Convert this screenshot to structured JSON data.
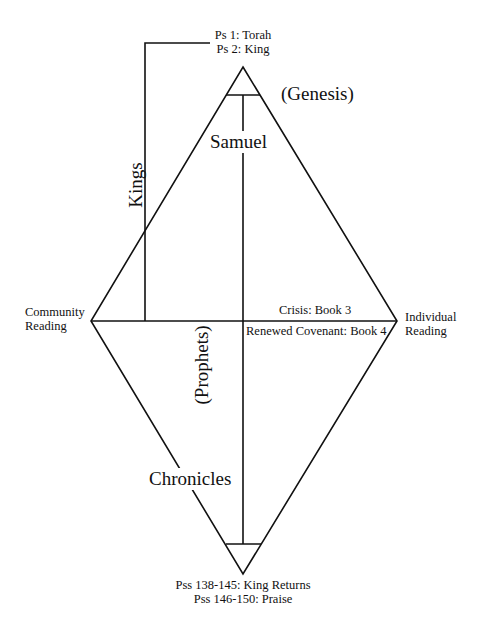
{
  "diagram": {
    "type": "rhombus-diagram",
    "colors": {
      "line": "#111111",
      "background": "#ffffff",
      "text": "#111111"
    },
    "top_label": {
      "line1": "Ps 1: Torah",
      "line2": "Ps 2: King"
    },
    "bottom_label": {
      "line1": "Pss 138-145: King Returns",
      "line2": "Pss 146-150: Praise"
    },
    "left_label": {
      "line1": "Community",
      "line2": "Reading"
    },
    "right_label": {
      "line1": "Individual",
      "line2": "Reading"
    },
    "axis_labels": {
      "above_horizontal": "Crisis: Book 3",
      "below_horizontal": "Renewed Covenant: Book 4"
    },
    "book_labels": {
      "genesis": "(Genesis)",
      "samuel": "Samuel",
      "kings": "Kings",
      "prophets": "(Prophets)",
      "chronicles": "Chronicles"
    }
  }
}
